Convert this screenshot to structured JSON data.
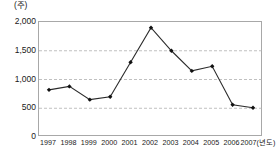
{
  "chart_data": {
    "type": "line",
    "title": "",
    "subtitle": "",
    "xlabel": "(년도)",
    "ylabel": "(주)",
    "unit_top_left": "(주)",
    "categories": [
      "1997",
      "1998",
      "1999",
      "2000",
      "2001",
      "2002",
      "2003",
      "2004",
      "2005",
      "2006",
      "2007"
    ],
    "values": [
      820,
      880,
      650,
      700,
      1300,
      1900,
      1500,
      1150,
      1230,
      560,
      510
    ],
    "series": [
      {
        "name": "",
        "values": [
          820,
          880,
          650,
          700,
          1300,
          1900,
          1500,
          1150,
          1230,
          560,
          510
        ]
      }
    ],
    "ylim": [
      0,
      2000
    ],
    "ytick_labels": [
      "0",
      "500",
      "1,000",
      "1,500",
      "2,000"
    ],
    "ytick_values": [
      0,
      500,
      1000,
      1500,
      2000
    ],
    "xtick_labels": [
      "1997",
      "1998",
      "1999",
      "2000",
      "2001",
      "2002",
      "2003",
      "2004",
      "2005",
      "2006",
      "2007"
    ],
    "grid": true,
    "grid_orientation": "horizontal",
    "grid_values": [
      500,
      1000,
      1500
    ],
    "legend": [],
    "legend_position": "none",
    "annotations": [],
    "marker": "diamond",
    "line_color": "#2b2b2b",
    "marker_color": "#111111",
    "grid_color": "#b0b0b0",
    "axis_color": "#a8a8a8",
    "background_color": "#ffffff"
  },
  "axis": {
    "x_unit_suffix": "(년도)",
    "y_unit": "(주)"
  }
}
